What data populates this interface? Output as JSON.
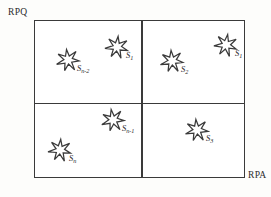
{
  "figure": {
    "background_color": "#fdfdfb",
    "line_color": "#3a3a3a",
    "axes": {
      "y_label": "RPQ",
      "x_label": "RPA"
    },
    "frame": {
      "left": 34,
      "top": 20,
      "width": 211,
      "height": 158,
      "divider_x": 141,
      "divider_y": 103
    },
    "marker_icon": "seven-pointed-star-icon",
    "markers": [
      {
        "id": "s-n-2",
        "base": "S",
        "subscript": "n-2",
        "quadrant": "top-left",
        "x": 68,
        "y": 60
      },
      {
        "id": "s-1-q2",
        "base": "S",
        "subscript": "1",
        "quadrant": "top-left",
        "x": 117,
        "y": 47
      },
      {
        "id": "s-2",
        "base": "S",
        "subscript": "2",
        "quadrant": "top-right",
        "x": 172,
        "y": 61
      },
      {
        "id": "s-1-q1",
        "base": "S",
        "subscript": "1",
        "quadrant": "top-right",
        "x": 226,
        "y": 45
      },
      {
        "id": "s-n-1",
        "base": "S",
        "subscript": "n-1",
        "quadrant": "bottom-left",
        "x": 113,
        "y": 120
      },
      {
        "id": "s-n",
        "base": "S",
        "subscript": "n",
        "quadrant": "bottom-left",
        "x": 60,
        "y": 150
      },
      {
        "id": "s-3",
        "base": "S",
        "subscript": "3",
        "quadrant": "bottom-right",
        "x": 197,
        "y": 130
      }
    ]
  }
}
